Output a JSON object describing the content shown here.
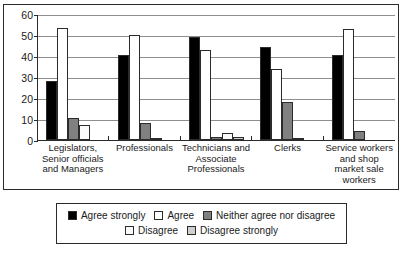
{
  "chart_data": {
    "type": "bar",
    "title": "",
    "subtitle": "",
    "xlabel": "",
    "ylabel": "",
    "ylim": [
      0,
      60
    ],
    "yticks": [
      0,
      10,
      20,
      30,
      40,
      50,
      60
    ],
    "grid": true,
    "legend_position": "bottom",
    "categories": [
      "Legislators, Senior officials and Managers",
      "Professionals",
      "Technicians and Associate Professionals",
      "Clerks",
      "Service workers and shop market sale workers"
    ],
    "series": [
      {
        "name": "Agree strongly",
        "color": "#000000",
        "values": [
          28.0,
          40.5,
          49.0,
          44.5,
          40.5
        ]
      },
      {
        "name": "Agree",
        "color": "#ffffff",
        "values": [
          53.5,
          50.0,
          43.0,
          34.0,
          53.0
        ]
      },
      {
        "name": "Neither agree nor disagree",
        "color": "#808080",
        "values": [
          10.5,
          8.0,
          1.5,
          18.0,
          4.5
        ]
      },
      {
        "name": "Disagree",
        "color": "#fafafa",
        "values": [
          7.0,
          1.0,
          3.5,
          1.0,
          0.0
        ]
      },
      {
        "name": "Disagree strongly",
        "color": "#cfcfcf",
        "values": [
          0.0,
          0.0,
          1.5,
          0.0,
          0.0
        ]
      }
    ]
  },
  "legend": {
    "row1": [
      "Agree strongly",
      "Agree",
      "Neither agree nor disagree"
    ],
    "row2": [
      "Disagree",
      "Disagree strongly"
    ]
  }
}
